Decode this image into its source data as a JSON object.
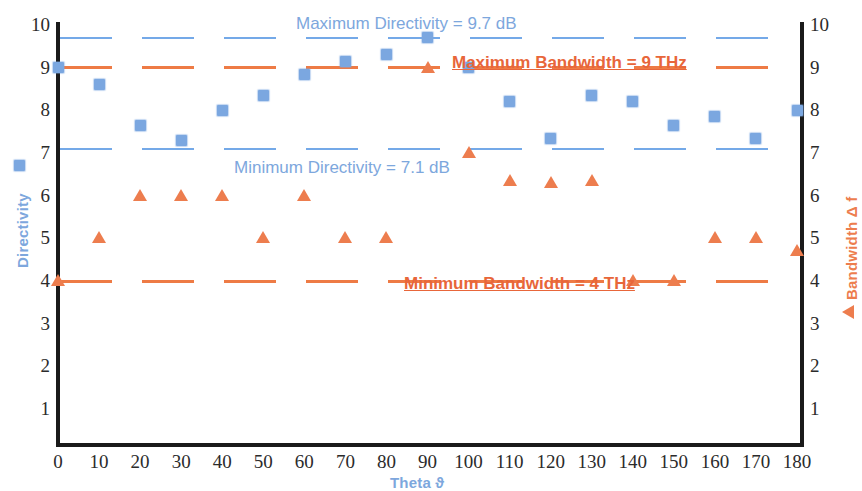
{
  "chart_data": {
    "type": "scatter",
    "title": "",
    "xlabel": "Theta ϑ",
    "ylabel_left": "Directivity",
    "ylabel_right": "Bandwidth Δ f",
    "xlim": [
      0,
      180
    ],
    "ylim": [
      0,
      10
    ],
    "xticks": [
      0,
      10,
      20,
      30,
      40,
      50,
      60,
      70,
      80,
      90,
      100,
      110,
      120,
      130,
      140,
      150,
      160,
      170,
      180
    ],
    "yticks": [
      1,
      2,
      3,
      4,
      5,
      6,
      7,
      8,
      9,
      10
    ],
    "grid": false,
    "legend_position": "axis-titles",
    "x": [
      0,
      10,
      20,
      30,
      40,
      50,
      60,
      70,
      80,
      90,
      100,
      110,
      120,
      130,
      140,
      150,
      160,
      170,
      180
    ],
    "series": [
      {
        "name": "Directivity",
        "marker": "square",
        "color": "#7ba7e0",
        "axis": "left",
        "units": "dB",
        "values": [
          9.0,
          8.6,
          7.65,
          7.3,
          8.0,
          8.35,
          8.85,
          9.15,
          9.3,
          9.7,
          9.0,
          8.2,
          7.35,
          8.35,
          8.2,
          7.65,
          7.85,
          7.35,
          8.0
        ]
      },
      {
        "name": "Bandwidth Δ f",
        "marker": "triangle",
        "color": "#ed7d4e",
        "axis": "right",
        "units": "THz",
        "values": [
          4.0,
          5.0,
          6.0,
          6.0,
          6.0,
          5.0,
          6.0,
          5.0,
          5.0,
          9.0,
          7.0,
          6.35,
          6.3,
          6.35,
          4.0,
          4.0,
          5.0,
          5.0,
          4.7
        ]
      }
    ],
    "reference_lines": [
      {
        "name": "max-directivity",
        "value": 9.7,
        "color": "#74a9e8",
        "style": "dashed",
        "axis": "left"
      },
      {
        "name": "min-directivity",
        "value": 7.1,
        "color": "#74a9e8",
        "style": "dashed",
        "axis": "left"
      },
      {
        "name": "max-bandwidth",
        "value": 9.0,
        "color": "#ee7b45",
        "style": "dashed",
        "axis": "right"
      },
      {
        "name": "min-bandwidth",
        "value": 4.0,
        "color": "#ee7b45",
        "style": "dashed",
        "axis": "right"
      }
    ],
    "annotations": [
      {
        "name": "max-directivity-label",
        "text": "Maximum Directivity = 9.7 dB",
        "color": "#7da7dd"
      },
      {
        "name": "min-directivity-label",
        "text": "Minimum Directivity = 7.1 dB",
        "color": "#7da7dd"
      },
      {
        "name": "max-bandwidth-label",
        "text": "Maximum Bandwidth  = 9 THz",
        "color": "#e8663a"
      },
      {
        "name": "min-bandwidth-label",
        "text": "Minimum Bandwidth  = 4 THz",
        "color": "#e8663a"
      }
    ]
  },
  "axes": {
    "y_left": {
      "title": "Directivity",
      "ticks": [
        "10",
        "9",
        "8",
        "7",
        "6",
        "5",
        "4",
        "3",
        "2",
        "1"
      ]
    },
    "y_right": {
      "title": "Bandwidth Δ f",
      "ticks": [
        "10",
        "9",
        "8",
        "7",
        "6",
        "5",
        "4",
        "3",
        "2",
        "1"
      ]
    },
    "x": {
      "title": "Theta ϑ",
      "ticks": [
        "0",
        "10",
        "20",
        "30",
        "40",
        "50",
        "60",
        "70",
        "80",
        "90",
        "100",
        "110",
        "120",
        "130",
        "140",
        "150",
        "160",
        "170",
        "180"
      ]
    }
  }
}
